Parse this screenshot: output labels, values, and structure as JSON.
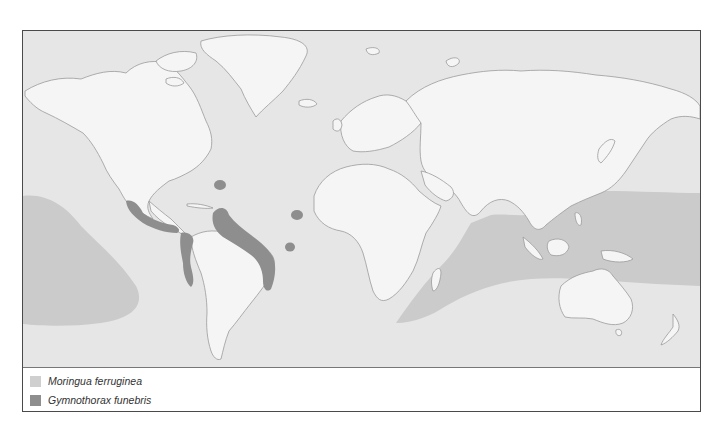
{
  "map": {
    "title": "",
    "colors": {
      "ocean": "#e6e6e6",
      "land": "#f4f4f4",
      "coastline": "#9a9a9a",
      "moringua_range": "#c7c7c7",
      "gymnothorax_range": "#8e8e8e"
    }
  },
  "legend": {
    "items": [
      {
        "label": "Moringua ferruginea",
        "color": "#cfcfcf"
      },
      {
        "label": "Gymnothorax funebris",
        "color": "#8e8e8e"
      }
    ]
  }
}
